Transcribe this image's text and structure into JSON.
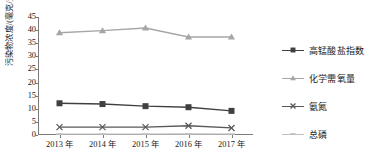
{
  "chart_data": {
    "type": "line",
    "title": "",
    "xlabel": "",
    "ylabel": "污染物浓度/(毫克/升)",
    "categories": [
      "2013 年",
      "2014 年",
      "2015 年",
      "2016 年",
      "2017 年"
    ],
    "yticks": [
      0,
      5,
      10,
      15,
      20,
      25,
      30,
      35,
      40,
      45
    ],
    "ylim": [
      0,
      45
    ],
    "grid": false,
    "legend_position": "right",
    "series": [
      {
        "name": "高锰酸盐指数",
        "values": [
          12.1,
          11.8,
          11.0,
          10.6,
          9.2
        ],
        "color": "#404040",
        "marker": "square"
      },
      {
        "name": "化学需氧量",
        "values": [
          39.0,
          39.8,
          40.8,
          37.4,
          37.4
        ],
        "color": "#a6a6a6",
        "marker": "triangle"
      },
      {
        "name": "氨氮",
        "values": [
          3.0,
          3.0,
          3.0,
          3.5,
          2.7
        ],
        "color": "#595959",
        "marker": "cross"
      },
      {
        "name": "总磷",
        "values": [
          0.35,
          0.35,
          0.35,
          0.4,
          0.35
        ],
        "color": "#bfbfbf",
        "marker": "dash"
      }
    ]
  }
}
